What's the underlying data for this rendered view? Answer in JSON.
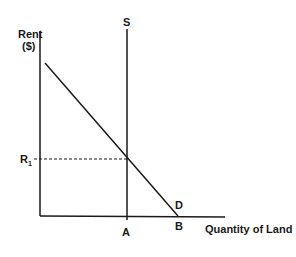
{
  "diagram": {
    "y_axis_label_line1": "Rent",
    "y_axis_label_line2": "($)",
    "x_axis_label": "Quantity of Land",
    "supply_label": "S",
    "demand_label": "D",
    "rent_level_label": "R",
    "rent_level_subscript": "1",
    "point_a_label": "A",
    "point_b_label": "B",
    "line_color": "#1a1a1a"
  }
}
